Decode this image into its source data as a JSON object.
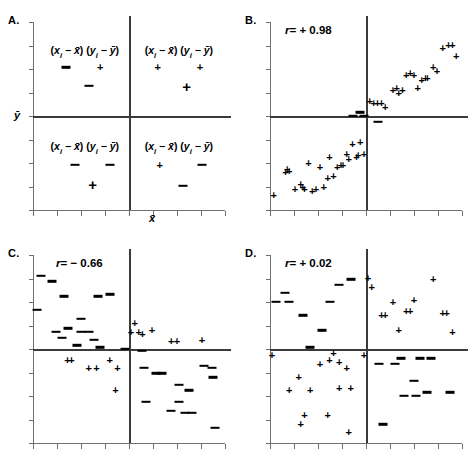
{
  "figure": {
    "title": "",
    "panel_count": 4,
    "marker_plus": "+",
    "marker_minus": "−",
    "axis_color": "#6f6f6f",
    "mean_line_color": "#3b3b3b",
    "marker_color": "#000000"
  },
  "panels": {
    "a": {
      "letter": "A.",
      "xlabel": "x̄",
      "ylabel": "ȳ",
      "quadrants": [
        {
          "name": "upper-left",
          "formula_prefix": "(x",
          "formula_sub": "i",
          "formula_rest": " − x̄) (y",
          "formula_sub2": "i",
          "formula_rest2": " − ȳ)",
          "sign_product": "−",
          "signs": [
            "−",
            "+",
            "−"
          ]
        },
        {
          "name": "upper-right",
          "formula_prefix": "(x",
          "formula_sub": "i",
          "formula_rest": " − x̄) (y",
          "formula_sub2": "i",
          "formula_rest2": " − ȳ)",
          "sign_product": "+",
          "signs": [
            "+",
            "+",
            "+"
          ]
        },
        {
          "name": "lower-left",
          "formula_prefix": "(x",
          "formula_sub": "i",
          "formula_rest": " − x̄) (y",
          "formula_sub2": "i",
          "formula_rest2": " − ȳ)",
          "sign_product": "+",
          "signs": [
            "−",
            "−",
            "+"
          ]
        },
        {
          "name": "lower-right",
          "formula_prefix": "(x",
          "formula_sub": "i",
          "formula_rest": " − x̄) (y",
          "formula_sub2": "i",
          "formula_rest2": " − ȳ)",
          "sign_product": "−",
          "signs": [
            "+",
            "−",
            "−"
          ]
        }
      ]
    },
    "b": {
      "letter": "B.",
      "r_prefix": "r",
      "r_value": "= + 0.98",
      "r_text": "r = + 0.98"
    },
    "c": {
      "letter": "C.",
      "r_prefix": "r",
      "r_value": "= − 0.66",
      "r_text": "r = − 0.66"
    },
    "d": {
      "letter": "D.",
      "r_prefix": "r",
      "r_value": "= + 0.02",
      "r_text": "r = + 0.02"
    }
  },
  "chart_data": [
    {
      "id": "A",
      "type": "scatter",
      "title": "A.",
      "xlabel": "x̄",
      "ylabel": "ȳ",
      "xlim": [
        0,
        100
      ],
      "ylim": [
        0,
        100
      ],
      "mean_x": 50,
      "mean_y": 50,
      "grid": false,
      "legend": null,
      "annotations": [
        {
          "text": "(x_i − x̄) (y_i − ȳ)",
          "x": 27,
          "y": 84,
          "quadrant": "upper-left"
        },
        {
          "text": "(x_i − x̄) (y_i − ȳ)",
          "x": 76,
          "y": 84,
          "quadrant": "upper-right"
        },
        {
          "text": "(x_i − x̄) (y_i − ȳ)",
          "x": 27,
          "y": 33,
          "quadrant": "lower-left"
        },
        {
          "text": "(x_i − x̄) (y_i − ȳ)",
          "x": 76,
          "y": 33,
          "quadrant": "lower-right"
        }
      ],
      "points": [
        {
          "x": 17,
          "y": 76,
          "marker": "−",
          "size": "small"
        },
        {
          "x": 35,
          "y": 76,
          "marker": "+",
          "size": "small"
        },
        {
          "x": 29,
          "y": 66,
          "marker": "−",
          "size": "small"
        },
        {
          "x": 65,
          "y": 76,
          "marker": "+",
          "size": "small"
        },
        {
          "x": 87,
          "y": 76,
          "marker": "+",
          "size": "small"
        },
        {
          "x": 80,
          "y": 66,
          "marker": "+",
          "size": "big"
        },
        {
          "x": 22,
          "y": 24,
          "marker": "−",
          "size": "small"
        },
        {
          "x": 40,
          "y": 24,
          "marker": "−",
          "size": "small"
        },
        {
          "x": 31,
          "y": 14,
          "marker": "+",
          "size": "big"
        },
        {
          "x": 66,
          "y": 24,
          "marker": "+",
          "size": "small"
        },
        {
          "x": 88,
          "y": 24,
          "marker": "−",
          "size": "small"
        },
        {
          "x": 78,
          "y": 13,
          "marker": "−",
          "size": "small"
        }
      ]
    },
    {
      "id": "B",
      "type": "scatter",
      "title": "B.",
      "annotation_r": "r = + 0.98",
      "r": 0.98,
      "xlim": [
        0,
        100
      ],
      "ylim": [
        0,
        100
      ],
      "mean_x": 50,
      "mean_y": 50,
      "grid": false,
      "points": [
        {
          "x": 2,
          "y": 8,
          "marker": "+"
        },
        {
          "x": 8,
          "y": 20,
          "marker": "+"
        },
        {
          "x": 10,
          "y": 21,
          "marker": "+"
        },
        {
          "x": 9,
          "y": 22,
          "marker": "+"
        },
        {
          "x": 13,
          "y": 11,
          "marker": "+"
        },
        {
          "x": 16,
          "y": 14,
          "marker": "+"
        },
        {
          "x": 17,
          "y": 12,
          "marker": "+"
        },
        {
          "x": 18,
          "y": 11,
          "marker": "+"
        },
        {
          "x": 20,
          "y": 25,
          "marker": "+"
        },
        {
          "x": 22,
          "y": 10,
          "marker": "+"
        },
        {
          "x": 24,
          "y": 11,
          "marker": "+"
        },
        {
          "x": 26,
          "y": 23,
          "marker": "+"
        },
        {
          "x": 28,
          "y": 12,
          "marker": "+"
        },
        {
          "x": 30,
          "y": 17,
          "marker": "+"
        },
        {
          "x": 31,
          "y": 28,
          "marker": "+"
        },
        {
          "x": 33,
          "y": 18,
          "marker": "+"
        },
        {
          "x": 35,
          "y": 23,
          "marker": "+"
        },
        {
          "x": 37,
          "y": 24,
          "marker": "+"
        },
        {
          "x": 38,
          "y": 24,
          "marker": "+"
        },
        {
          "x": 40,
          "y": 30,
          "marker": "+"
        },
        {
          "x": 41,
          "y": 27,
          "marker": "+"
        },
        {
          "x": 43,
          "y": 35,
          "marker": "+"
        },
        {
          "x": 45,
          "y": 28,
          "marker": "+"
        },
        {
          "x": 46,
          "y": 29,
          "marker": "+"
        },
        {
          "x": 47,
          "y": 36,
          "marker": "+"
        },
        {
          "x": 49,
          "y": 30,
          "marker": "+"
        },
        {
          "x": 43,
          "y": 50,
          "marker": "−"
        },
        {
          "x": 47,
          "y": 52,
          "marker": "−"
        },
        {
          "x": 49,
          "y": 50,
          "marker": "−"
        },
        {
          "x": 56,
          "y": 47,
          "marker": "−"
        },
        {
          "x": 52,
          "y": 58,
          "marker": "+"
        },
        {
          "x": 54,
          "y": 57,
          "marker": "+"
        },
        {
          "x": 56,
          "y": 57,
          "marker": "+"
        },
        {
          "x": 58,
          "y": 57,
          "marker": "+"
        },
        {
          "x": 60,
          "y": 55,
          "marker": "+"
        },
        {
          "x": 64,
          "y": 64,
          "marker": "+"
        },
        {
          "x": 66,
          "y": 65,
          "marker": "+"
        },
        {
          "x": 67,
          "y": 62,
          "marker": "+"
        },
        {
          "x": 69,
          "y": 64,
          "marker": "+"
        },
        {
          "x": 71,
          "y": 72,
          "marker": "+"
        },
        {
          "x": 73,
          "y": 73,
          "marker": "+"
        },
        {
          "x": 75,
          "y": 72,
          "marker": "+"
        },
        {
          "x": 77,
          "y": 65,
          "marker": "+"
        },
        {
          "x": 79,
          "y": 69,
          "marker": "+"
        },
        {
          "x": 81,
          "y": 70,
          "marker": "+"
        },
        {
          "x": 82,
          "y": 70,
          "marker": "+"
        },
        {
          "x": 85,
          "y": 76,
          "marker": "+"
        },
        {
          "x": 87,
          "y": 74,
          "marker": "+"
        },
        {
          "x": 90,
          "y": 86,
          "marker": "+"
        },
        {
          "x": 93,
          "y": 88,
          "marker": "+"
        },
        {
          "x": 95,
          "y": 88,
          "marker": "+"
        },
        {
          "x": 97,
          "y": 82,
          "marker": "+"
        }
      ]
    },
    {
      "id": "C",
      "type": "scatter",
      "title": "C.",
      "annotation_r": "r = − 0.66",
      "r": -0.66,
      "xlim": [
        0,
        100
      ],
      "ylim": [
        0,
        100
      ],
      "mean_x": 50,
      "mean_y": 50,
      "grid": false,
      "points": [
        {
          "x": 4,
          "y": 89,
          "marker": "−"
        },
        {
          "x": 10,
          "y": 86,
          "marker": "−"
        },
        {
          "x": 16,
          "y": 78,
          "marker": "−"
        },
        {
          "x": 2,
          "y": 71,
          "marker": "−"
        },
        {
          "x": 25,
          "y": 66,
          "marker": "−"
        },
        {
          "x": 34,
          "y": 78,
          "marker": "−"
        },
        {
          "x": 40,
          "y": 79,
          "marker": "−"
        },
        {
          "x": 12,
          "y": 59,
          "marker": "−"
        },
        {
          "x": 18,
          "y": 61,
          "marker": "−"
        },
        {
          "x": 15,
          "y": 56,
          "marker": "−"
        },
        {
          "x": 25,
          "y": 59,
          "marker": "−"
        },
        {
          "x": 29,
          "y": 59,
          "marker": "−"
        },
        {
          "x": 32,
          "y": 55,
          "marker": "−"
        },
        {
          "x": 23,
          "y": 52,
          "marker": "−"
        },
        {
          "x": 35,
          "y": 51,
          "marker": "−"
        },
        {
          "x": 48,
          "y": 50,
          "marker": "−"
        },
        {
          "x": 57,
          "y": 49,
          "marker": "−"
        },
        {
          "x": 53,
          "y": 64,
          "marker": "+"
        },
        {
          "x": 51,
          "y": 59,
          "marker": "+"
        },
        {
          "x": 55,
          "y": 59,
          "marker": "+"
        },
        {
          "x": 57,
          "y": 58,
          "marker": "+"
        },
        {
          "x": 62,
          "y": 60,
          "marker": "+"
        },
        {
          "x": 72,
          "y": 54,
          "marker": "+"
        },
        {
          "x": 75,
          "y": 54,
          "marker": "+"
        },
        {
          "x": 88,
          "y": 55,
          "marker": "+"
        },
        {
          "x": 18,
          "y": 44,
          "marker": "+"
        },
        {
          "x": 20,
          "y": 44,
          "marker": "+"
        },
        {
          "x": 29,
          "y": 40,
          "marker": "+"
        },
        {
          "x": 33,
          "y": 40,
          "marker": "+"
        },
        {
          "x": 40,
          "y": 44,
          "marker": "+"
        },
        {
          "x": 44,
          "y": 40,
          "marker": "+"
        },
        {
          "x": 43,
          "y": 28,
          "marker": "+"
        },
        {
          "x": 58,
          "y": 40,
          "marker": "−"
        },
        {
          "x": 64,
          "y": 37,
          "marker": "−"
        },
        {
          "x": 67,
          "y": 37,
          "marker": "−"
        },
        {
          "x": 89,
          "y": 41,
          "marker": "−"
        },
        {
          "x": 93,
          "y": 40,
          "marker": "−"
        },
        {
          "x": 94,
          "y": 35,
          "marker": "−"
        },
        {
          "x": 76,
          "y": 31,
          "marker": "−"
        },
        {
          "x": 81,
          "y": 28,
          "marker": "−"
        },
        {
          "x": 59,
          "y": 22,
          "marker": "−"
        },
        {
          "x": 76,
          "y": 22,
          "marker": "−"
        },
        {
          "x": 72,
          "y": 17,
          "marker": "−"
        },
        {
          "x": 79,
          "y": 16,
          "marker": "−"
        },
        {
          "x": 83,
          "y": 16,
          "marker": "−"
        },
        {
          "x": 95,
          "y": 8,
          "marker": "−"
        }
      ]
    },
    {
      "id": "D",
      "type": "scatter",
      "title": "D.",
      "annotation_r": "r = + 0.02",
      "r": 0.02,
      "xlim": [
        0,
        100
      ],
      "ylim": [
        0,
        100
      ],
      "mean_x": 50,
      "mean_y": 50,
      "grid": false,
      "points": [
        {
          "x": 8,
          "y": 80,
          "marker": "−"
        },
        {
          "x": 3,
          "y": 75,
          "marker": "−"
        },
        {
          "x": 10,
          "y": 75,
          "marker": "−"
        },
        {
          "x": 17,
          "y": 68,
          "marker": "−"
        },
        {
          "x": 31,
          "y": 75,
          "marker": "−"
        },
        {
          "x": 36,
          "y": 84,
          "marker": "−"
        },
        {
          "x": 42,
          "y": 87,
          "marker": "−"
        },
        {
          "x": 27,
          "y": 60,
          "marker": "−"
        },
        {
          "x": 21,
          "y": 51,
          "marker": "−"
        },
        {
          "x": 51,
          "y": 88,
          "marker": "+"
        },
        {
          "x": 53,
          "y": 83,
          "marker": "+"
        },
        {
          "x": 85,
          "y": 87,
          "marker": "+"
        },
        {
          "x": 64,
          "y": 75,
          "marker": "+"
        },
        {
          "x": 75,
          "y": 76,
          "marker": "+"
        },
        {
          "x": 71,
          "y": 70,
          "marker": "+"
        },
        {
          "x": 73,
          "y": 70,
          "marker": "+"
        },
        {
          "x": 58,
          "y": 68,
          "marker": "+"
        },
        {
          "x": 60,
          "y": 68,
          "marker": "+"
        },
        {
          "x": 90,
          "y": 69,
          "marker": "+"
        },
        {
          "x": 92,
          "y": 69,
          "marker": "+"
        },
        {
          "x": 67,
          "y": 60,
          "marker": "+"
        },
        {
          "x": 95,
          "y": 59,
          "marker": "+"
        },
        {
          "x": 1,
          "y": 47,
          "marker": "+"
        },
        {
          "x": 33,
          "y": 48,
          "marker": "+"
        },
        {
          "x": 49,
          "y": 47,
          "marker": "+"
        },
        {
          "x": 26,
          "y": 42,
          "marker": "+"
        },
        {
          "x": 31,
          "y": 44,
          "marker": "+"
        },
        {
          "x": 36,
          "y": 43,
          "marker": "+"
        },
        {
          "x": 40,
          "y": 40,
          "marker": "+"
        },
        {
          "x": 15,
          "y": 35,
          "marker": "+"
        },
        {
          "x": 10,
          "y": 28,
          "marker": "+"
        },
        {
          "x": 21,
          "y": 28,
          "marker": "+"
        },
        {
          "x": 36,
          "y": 29,
          "marker": "+"
        },
        {
          "x": 42,
          "y": 29,
          "marker": "+"
        },
        {
          "x": 18,
          "y": 15,
          "marker": "+"
        },
        {
          "x": 30,
          "y": 15,
          "marker": "+"
        },
        {
          "x": 16,
          "y": 10,
          "marker": "+"
        },
        {
          "x": 41,
          "y": 6,
          "marker": "+"
        },
        {
          "x": 57,
          "y": 42,
          "marker": "−"
        },
        {
          "x": 65,
          "y": 42,
          "marker": "−"
        },
        {
          "x": 68,
          "y": 45,
          "marker": "−"
        },
        {
          "x": 78,
          "y": 45,
          "marker": "−"
        },
        {
          "x": 84,
          "y": 45,
          "marker": "−"
        },
        {
          "x": 75,
          "y": 33,
          "marker": "−"
        },
        {
          "x": 70,
          "y": 25,
          "marker": "−"
        },
        {
          "x": 76,
          "y": 25,
          "marker": "−"
        },
        {
          "x": 82,
          "y": 27,
          "marker": "−"
        },
        {
          "x": 94,
          "y": 27,
          "marker": "−"
        },
        {
          "x": 59,
          "y": 10,
          "marker": "−"
        }
      ]
    }
  ]
}
